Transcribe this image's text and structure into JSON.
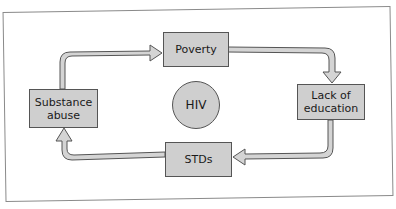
{
  "diagram": {
    "type": "cycle",
    "center": {
      "label": "HIV"
    },
    "nodes": [
      {
        "id": "poverty",
        "label": "Poverty"
      },
      {
        "id": "lack-of-education",
        "label": "Lack of education",
        "lines": [
          "Lack of",
          "education"
        ]
      },
      {
        "id": "stds",
        "label": "STDs"
      },
      {
        "id": "substance-abuse",
        "label": "Substance abuse",
        "lines": [
          "Substance",
          "abuse"
        ]
      }
    ],
    "edges": [
      {
        "from": "poverty",
        "to": "lack-of-education"
      },
      {
        "from": "lack-of-education",
        "to": "stds"
      },
      {
        "from": "stds",
        "to": "substance-abuse"
      },
      {
        "from": "substance-abuse",
        "to": "poverty"
      }
    ],
    "colors": {
      "box_fill": "#cfcfcf",
      "box_border": "#555555",
      "arrow_fill": "#d4d4d4",
      "frame_border": "#8a8a8a"
    }
  }
}
